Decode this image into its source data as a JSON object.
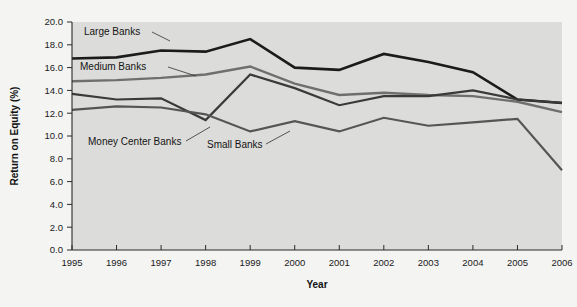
{
  "chart_data": {
    "type": "line",
    "title": "",
    "xlabel": "Year",
    "ylabel": "Return on Equity (%)",
    "x": [
      1995,
      1996,
      1997,
      1998,
      1999,
      2000,
      2001,
      2002,
      2003,
      2004,
      2005,
      2006
    ],
    "categories": [
      "1995",
      "1996",
      "1997",
      "1998",
      "1999",
      "2000",
      "2001",
      "2002",
      "2003",
      "2004",
      "2005",
      "2006"
    ],
    "xlim": [
      1995,
      2006
    ],
    "ylim": [
      0.0,
      20.0
    ],
    "ytick_labels": [
      "20.0",
      "18.0",
      "16.0",
      "14.0",
      "12.0",
      "10.0",
      "8.0",
      "6.0",
      "4.0",
      "2.0",
      "0.0"
    ],
    "ytick_values": [
      20.0,
      18.0,
      16.0,
      14.0,
      12.0,
      10.0,
      8.0,
      6.0,
      4.0,
      2.0,
      0.0
    ],
    "grid": false,
    "legend_position": "inline-annotations",
    "series": [
      {
        "name": "Large Banks",
        "color": "#1b1b1b",
        "width": 2.6,
        "values": [
          16.8,
          16.9,
          17.5,
          17.4,
          18.5,
          16.0,
          15.8,
          17.2,
          16.5,
          15.6,
          13.2,
          12.9
        ]
      },
      {
        "name": "Medium Banks",
        "color": "#6f6f6f",
        "width": 2.4,
        "values": [
          14.8,
          14.9,
          15.1,
          15.4,
          16.1,
          14.6,
          13.6,
          13.8,
          13.6,
          13.5,
          13.0,
          12.1
        ]
      },
      {
        "name": "Money Center Banks",
        "color": "#3a3a3a",
        "width": 2.2,
        "values": [
          13.7,
          13.2,
          13.3,
          11.4,
          15.4,
          14.2,
          12.7,
          13.5,
          13.5,
          14.0,
          13.2,
          12.9
        ]
      },
      {
        "name": "Small Banks",
        "color": "#555555",
        "width": 2.2,
        "values": [
          12.3,
          12.6,
          12.5,
          11.9,
          10.4,
          11.3,
          10.4,
          11.6,
          10.9,
          11.2,
          11.5,
          7.0
        ]
      }
    ],
    "annotations": [
      {
        "label": "Large Banks",
        "text_x": 84,
        "text_y": 35,
        "leader": [
          [
            152,
            32
          ],
          [
            170,
            41
          ]
        ]
      },
      {
        "label": "Medium Banks",
        "text_x": 80,
        "text_y": 70,
        "leader": [
          [
            168,
            67
          ],
          [
            196,
            76
          ]
        ]
      },
      {
        "label": "Money Center Banks",
        "text_x": 88,
        "text_y": 145,
        "leader": [
          [
            186,
            141
          ],
          [
            210,
            127
          ]
        ]
      },
      {
        "label": "Small Banks",
        "text_x": 207,
        "text_y": 148,
        "leader": [
          [
            266,
            144
          ],
          [
            290,
            131
          ]
        ]
      }
    ],
    "plot_area": {
      "left": 72,
      "right": 562,
      "top": 22,
      "bottom": 250,
      "background_color": "#dcdcda",
      "outer_background_color": "#f4f4f3"
    }
  }
}
